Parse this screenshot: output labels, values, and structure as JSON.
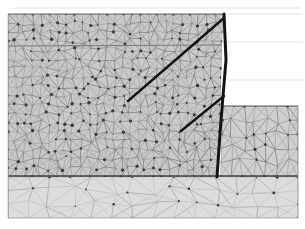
{
  "figure": {
    "caption": "Triangular finite element mesh of a layered soil cross-section with an excavation step and a bold structural wall element.",
    "width": 305,
    "height": 229,
    "background_color": "#ffffff"
  },
  "palette": {
    "background": "#ffffff",
    "mesh_fill_upper": "#c9c9c9",
    "mesh_fill_lower": "#dcdcdc",
    "mesh_fill_right": "#cfcfcf",
    "mesh_line": "#6f6f6f",
    "mesh_line_light": "#9a9a9a",
    "node_color": "#3a3a3a",
    "boundary_line": "#4a4a4a",
    "bold_structure": "#141414",
    "faint_guide": "#d8d8d8"
  },
  "regions": [
    {
      "id": "upper-soil-block",
      "name": "Upper soil layer mesh",
      "fill": "#c9c9c9",
      "density": "fine",
      "polygon": [
        [
          8,
          14
        ],
        [
          223,
          14
        ],
        [
          218,
          177
        ],
        [
          8,
          177
        ]
      ]
    },
    {
      "id": "lower-soil-block",
      "name": "Lower soil layer mesh",
      "fill": "#dcdcdc",
      "density": "coarse",
      "polygon": [
        [
          8,
          177
        ],
        [
          298,
          177
        ],
        [
          298,
          218
        ],
        [
          8,
          218
        ]
      ]
    },
    {
      "id": "right-bench-block",
      "name": "Right excavation bench mesh",
      "fill": "#cfcfcf",
      "density": "medium",
      "polygon": [
        [
          223,
          106
        ],
        [
          298,
          106
        ],
        [
          298,
          177
        ],
        [
          220,
          177
        ]
      ]
    }
  ],
  "boundaries": [
    {
      "id": "top-edge",
      "name": "Top ground surface",
      "points": [
        [
          8,
          14
        ],
        [
          223,
          14
        ]
      ],
      "width": 1.1,
      "color": "#6a6a6a"
    },
    {
      "id": "sub-layer-1",
      "name": "Upper sub-layer interface",
      "points": [
        [
          8,
          46
        ],
        [
          222,
          45
        ]
      ],
      "width": 1.0,
      "color": "#7a7a7a"
    },
    {
      "id": "layer-interface",
      "name": "Main layer interface",
      "points": [
        [
          8,
          176
        ],
        [
          298,
          176
        ]
      ],
      "width": 1.6,
      "color": "#3f3f3f"
    },
    {
      "id": "bench-surface",
      "name": "Excavation bench surface",
      "points": [
        [
          223,
          106
        ],
        [
          298,
          106
        ]
      ],
      "width": 1.2,
      "color": "#5e5e5e"
    },
    {
      "id": "bottom-edge",
      "name": "Model base",
      "points": [
        [
          8,
          218
        ],
        [
          298,
          218
        ]
      ],
      "width": 1.0,
      "color": "#b4b4b4"
    },
    {
      "id": "left-edge",
      "name": "Left model boundary",
      "points": [
        [
          8,
          14
        ],
        [
          8,
          218
        ]
      ],
      "width": 1.0,
      "color": "#8a8a8a"
    },
    {
      "id": "right-edge",
      "name": "Right model boundary",
      "points": [
        [
          298,
          106
        ],
        [
          298,
          218
        ]
      ],
      "width": 1.0,
      "color": "#a0a0a0"
    }
  ],
  "faint_guides": [
    {
      "id": "guide-top",
      "name": "Faint guide line above model",
      "points": [
        [
          14,
          8
        ],
        [
          300,
          8
        ]
      ],
      "color": "#dcdcdc"
    },
    {
      "id": "guide-right-1",
      "name": "Faint guide line right upper",
      "points": [
        [
          226,
          14
        ],
        [
          303,
          14
        ]
      ],
      "color": "#dedede"
    },
    {
      "id": "guide-right-2",
      "name": "Faint guide line right mid",
      "points": [
        [
          228,
          42
        ],
        [
          303,
          42
        ]
      ],
      "color": "#e0e0e0"
    },
    {
      "id": "guide-right-3",
      "name": "Faint guide line right lower",
      "points": [
        [
          228,
          80
        ],
        [
          303,
          80
        ]
      ],
      "color": "#dddddd"
    }
  ],
  "structures": [
    {
      "id": "retaining-wall",
      "name": "Retaining wall structural element",
      "points": [
        [
          224,
          14
        ],
        [
          226,
          60
        ],
        [
          221,
          120
        ],
        [
          217,
          177
        ]
      ],
      "width": 3.0,
      "color": "#141414"
    },
    {
      "id": "anchor-upper",
      "name": "Upper anchor / tie-back element",
      "points": [
        [
          128,
          101
        ],
        [
          224,
          18
        ]
      ],
      "width": 2.4,
      "color": "#141414"
    },
    {
      "id": "anchor-lower",
      "name": "Lower anchor / tie-back element",
      "points": [
        [
          181,
          131
        ],
        [
          224,
          96
        ]
      ],
      "width": 2.4,
      "color": "#141414"
    }
  ],
  "labels": {
    "figure_label": "",
    "axis_x": "",
    "axis_y": ""
  },
  "mesh_params": {
    "upper_cols": 26,
    "upper_rows": 18,
    "lower_cols": 14,
    "lower_rows": 3,
    "right_cols": 7,
    "right_rows": 5,
    "node_radius": 1.15,
    "jitter": 0.34,
    "seed": 20240517
  }
}
